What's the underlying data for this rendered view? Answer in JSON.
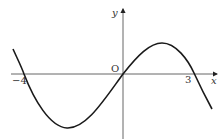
{
  "diagram": {
    "type": "function-graph",
    "axes": {
      "x_label": "x",
      "y_label": "y",
      "origin_label": "O"
    },
    "ticks": {
      "neg4": "−4",
      "three": "3"
    },
    "roots": [
      -4,
      0,
      3
    ],
    "colors": {
      "curve": "#1a1a1a",
      "axis": "#555555",
      "background": "#ffffff"
    }
  }
}
